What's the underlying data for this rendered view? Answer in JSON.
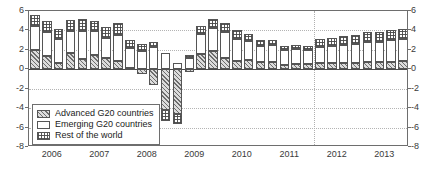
{
  "chart_data": {
    "type": "bar",
    "title": "",
    "subtitle": "",
    "xlabel": "",
    "ylabel": "",
    "stacked": true,
    "ylim": [
      -8,
      6
    ],
    "yticks": [
      6,
      4,
      2,
      0,
      -2,
      -4,
      -6,
      -8
    ],
    "ytick_labels": [
      "6",
      "4",
      "2",
      "0",
      "-2",
      "-4",
      "-6",
      "-8"
    ],
    "grid": "horizontal-dotted",
    "legend_position": "inside-lower-left",
    "axis_labels_both_sides": true,
    "vertical_marker_x": "2011Q4",
    "categories": [
      "2006Q1",
      "2006Q2",
      "2006Q3",
      "2006Q4",
      "2007Q1",
      "2007Q2",
      "2007Q3",
      "2007Q4",
      "2008Q1",
      "2008Q2",
      "2008Q3",
      "2008Q4",
      "2009Q1",
      "2009Q2",
      "2009Q3",
      "2009Q4",
      "2010Q1",
      "2010Q2",
      "2010Q3",
      "2010Q4",
      "2011Q1",
      "2011Q2",
      "2011Q3",
      "2011Q4",
      "2012Q1",
      "2012Q2",
      "2012Q3",
      "2012Q4",
      "2013Q1",
      "2013Q2",
      "2013Q3",
      "2013Q4"
    ],
    "xtick_labels": [
      "2006",
      "2007",
      "2008",
      "2009",
      "2010",
      "2011",
      "2012",
      "2013"
    ],
    "series": [
      {
        "name": "Advanced G20 countries",
        "pattern": "diagonal-hatch",
        "values": [
          2.0,
          1.4,
          0.6,
          1.7,
          1.1,
          1.5,
          1.2,
          0.9,
          0.1,
          -0.5,
          -1.6,
          -4.2,
          -4.6,
          -0.3,
          1.6,
          1.9,
          1.2,
          0.9,
          1.0,
          0.8,
          0.8,
          0.4,
          0.5,
          0.5,
          0.6,
          0.6,
          0.6,
          0.6,
          0.7,
          0.7,
          0.8,
          0.9
        ]
      },
      {
        "name": "Emerging G20 countries",
        "pattern": "empty",
        "values": [
          2.5,
          2.4,
          2.5,
          2.2,
          2.8,
          2.4,
          2.0,
          2.6,
          2.1,
          1.9,
          2.3,
          1.7,
          0.6,
          1.2,
          2.0,
          2.3,
          2.6,
          2.2,
          1.9,
          1.6,
          1.7,
          1.6,
          1.6,
          1.5,
          1.7,
          1.8,
          1.9,
          2.0,
          2.1,
          2.1,
          2.2,
          2.2
        ]
      },
      {
        "name": "Rest of the world",
        "pattern": "checker",
        "values": [
          1.1,
          1.2,
          1.0,
          1.2,
          1.3,
          1.1,
          1.2,
          1.3,
          0.8,
          0.7,
          0.5,
          -1.1,
          -1.0,
          0.3,
          0.9,
          1.0,
          1.0,
          0.9,
          0.7,
          0.6,
          0.5,
          0.4,
          0.4,
          0.4,
          0.8,
          0.8,
          0.9,
          0.9,
          1.0,
          1.0,
          1.0,
          1.0
        ]
      }
    ]
  },
  "legend": {
    "items": [
      {
        "label": "Advanced G20 countries",
        "pattern": "diagonal-hatch"
      },
      {
        "label": "Emerging G20 countries",
        "pattern": "empty"
      },
      {
        "label": "Rest of the world",
        "pattern": "checker"
      }
    ]
  },
  "colors": {
    "axis": "#6e6e6e",
    "grid": "#b4b4b4",
    "text": "#3a3a3a",
    "hatch": "#5a5a5a",
    "fill_light": "#dcdcdc",
    "background": "#ffffff"
  }
}
